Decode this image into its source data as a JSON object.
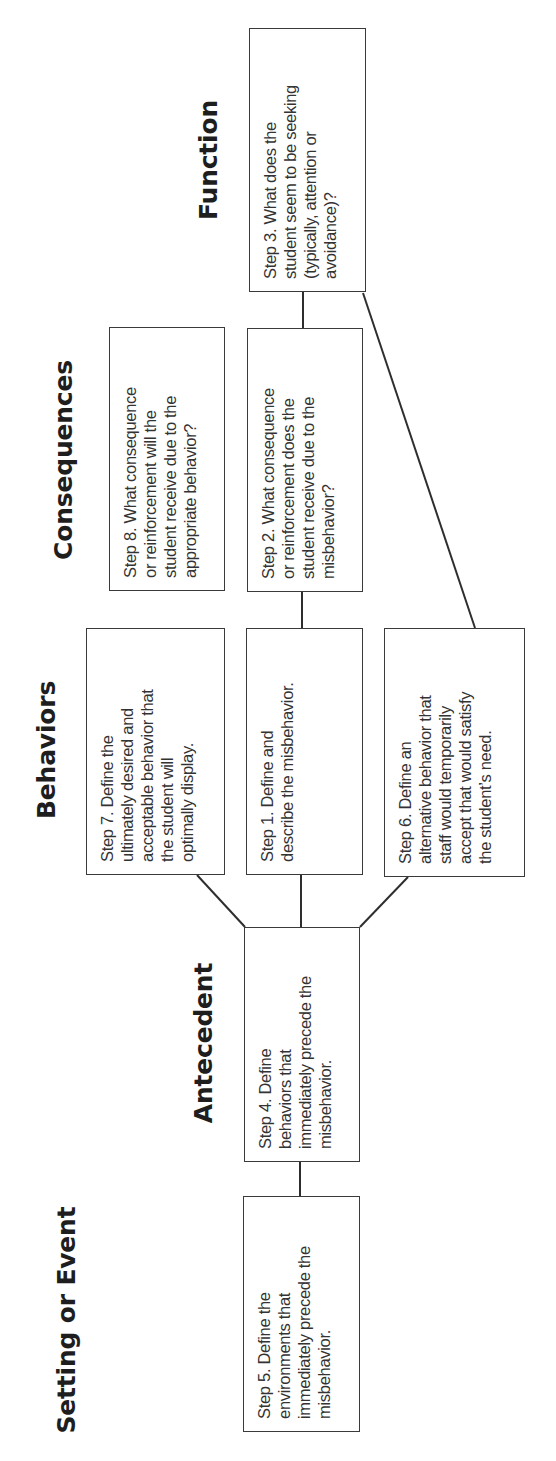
{
  "orientation": "rotated-90-ccw",
  "headings": {
    "setting": "Setting or Event",
    "antecedent": "Antecedent",
    "behaviors": "Behaviors",
    "consequences": "Consequences",
    "function": "Function"
  },
  "steps": {
    "step1": "Step 1. Define and\ndescribe the misbehavior.",
    "step2": "Step 2. What consequence\nor reinforcement does the\nstudent receive due to the\nmisbehavior?",
    "step3": "Step 3. What does the\nstudent seem to be seeking\n(typically, attention or\navoidance)?",
    "step4": "Step 4. Define\nbehaviors that\nimmediately precede the\nmisbehavior.",
    "step5": "Step 5. Define the\nenvironments that\nimmediately precede the\nmisbehavior.",
    "step6": "Step 6. Define an\nalternative behavior that\nstaff would temporarily\naccept that would satisfy\nthe student’s need.",
    "step7": "Step 7. Define the\nultimately desired and\nacceptable behavior that\nthe student will\noptimally display.",
    "step8": "Step 8. What consequence\nor reinforcement will the\nstudent receive due to the\nappropriate behavior?"
  },
  "colors": {
    "line": "#2e2e2e",
    "box_border": "#3a3a3a",
    "text": "#333333",
    "heading": "#1e1e1e",
    "background": "#ffffff"
  }
}
